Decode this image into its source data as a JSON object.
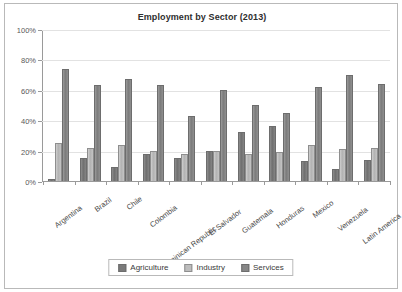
{
  "chart_data": {
    "type": "bar",
    "title": "Employment by Sector (2013)",
    "xlabel": "",
    "ylabel": "",
    "ylim": [
      0,
      100
    ],
    "ytick_labels": [
      "100%",
      "80%",
      "60%",
      "40%",
      "20%",
      "0%"
    ],
    "ytick_values": [
      100,
      80,
      60,
      40,
      20,
      0
    ],
    "grid": true,
    "legend_position": "bottom",
    "categories": [
      "Argentina",
      "Brazil",
      "Chile",
      "Colombia",
      "Dominican Republic",
      "El Salvador",
      "Guatemala",
      "Honduras",
      "Mexico",
      "Venezuela",
      "Latin America"
    ],
    "series": [
      {
        "name": "Agriculture",
        "color": "#7a7a7a",
        "values": [
          1,
          15,
          9,
          18,
          15,
          20,
          32,
          36,
          13,
          8,
          14
        ]
      },
      {
        "name": "Industry",
        "color": "#bdbdbd",
        "values": [
          25,
          22,
          24,
          20,
          18,
          20,
          18,
          19,
          24,
          21,
          22
        ]
      },
      {
        "name": "Services",
        "color": "#878787",
        "values": [
          74,
          63,
          67,
          63,
          43,
          60,
          50,
          45,
          62,
          70,
          64
        ]
      }
    ]
  }
}
